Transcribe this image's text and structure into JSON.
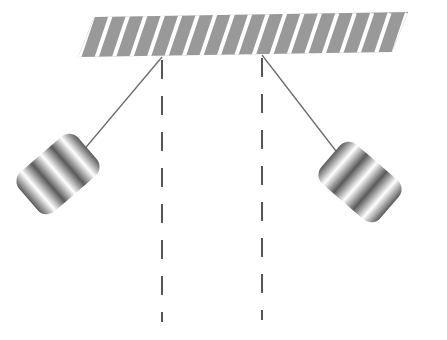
{
  "diagram": {
    "canvas": {
      "width": 447,
      "height": 340,
      "background": "#ffffff"
    },
    "ceiling": {
      "name": "hatched-ceiling-support",
      "fill": "#999999",
      "hatch_color": "#ffffff",
      "hatch_count": 19,
      "hatch_angle_deg": -22,
      "left_x": 78,
      "right_x": 392,
      "top_y_left": 17,
      "top_y_right": 12,
      "bottom_y_left": 57,
      "bottom_y_right": 52,
      "skew_deg": -22
    },
    "pivots": [
      {
        "label": "left-pivot",
        "x": 162,
        "y": 56
      },
      {
        "label": "right-pivot",
        "x": 262,
        "y": 54
      }
    ],
    "equilibrium_lines": [
      {
        "label": "left-equilibrium-line",
        "x": 162,
        "y_start": 60,
        "y_end": 322,
        "color": "#555555",
        "width": 2,
        "dash_on": 19,
        "dash_off": 17
      },
      {
        "label": "right-equilibrium-line",
        "x": 262,
        "y_start": 58,
        "y_end": 320,
        "color": "#555555",
        "width": 2,
        "dash_on": 19,
        "dash_off": 17
      }
    ],
    "strings": [
      {
        "label": "left-pendulum-string",
        "x1": 162,
        "y1": 57,
        "x2": 82,
        "y2": 152,
        "color": "#6b6b6b",
        "width": 1.3
      },
      {
        "label": "right-pendulum-string",
        "x1": 262,
        "y1": 55,
        "x2": 346,
        "y2": 164,
        "color": "#6b6b6b",
        "width": 1.3
      }
    ],
    "bobs": [
      {
        "label": "left-pendulum-bob",
        "center_x": 58,
        "center_y": 174,
        "width": 78,
        "height": 52,
        "corner_radius": 12,
        "rotation_deg": -41,
        "highlight_color": "#ffffff",
        "shadow_color": "#5a5a5a",
        "band_count": 3
      },
      {
        "label": "right-pendulum-bob",
        "center_x": 360,
        "center_y": 182,
        "width": 78,
        "height": 52,
        "corner_radius": 12,
        "rotation_deg": 41,
        "highlight_color": "#ffffff",
        "shadow_color": "#5a5a5a",
        "band_count": 3
      }
    ]
  }
}
